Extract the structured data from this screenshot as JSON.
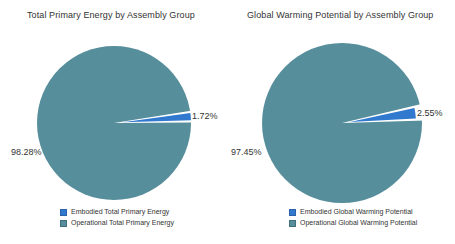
{
  "palette": {
    "embodied_blue": "#3079ce",
    "operational_teal": "#578e9b",
    "chip_borders": [
      "#2b62a9",
      "#41707b"
    ],
    "background": "#ffffff",
    "text": "#333333"
  },
  "chart_data": [
    {
      "type": "pie",
      "title": "Total Primary Energy by Assembly Group",
      "labels": [
        "Embodied Total Primary Energy",
        "Operational Total Primary Energy"
      ],
      "values": [
        1.72,
        98.28
      ],
      "colors": [
        "#3079ce",
        "#578e9b"
      ],
      "annotations": [
        "1.72%",
        "98.28%"
      ],
      "legend_position": "bottom",
      "exploded_slice": "Embodied Total Primary Energy"
    },
    {
      "type": "pie",
      "title": "Global Warming Potential by Assembly Group",
      "labels": [
        "Embodied Global Warming Potential",
        "Operational Global Warming Potential"
      ],
      "values": [
        2.55,
        97.45
      ],
      "colors": [
        "#3079ce",
        "#578e9b"
      ],
      "annotations": [
        "2.55%",
        "97.45%"
      ],
      "legend_position": "bottom",
      "exploded_slice": "Embodied Global Warming Potential"
    }
  ]
}
